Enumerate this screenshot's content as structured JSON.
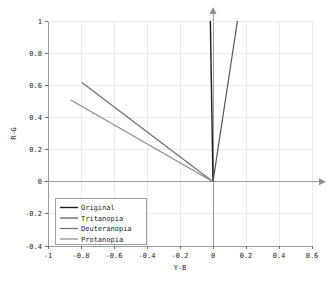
{
  "chart_data": {
    "type": "line",
    "title": "",
    "xlabel": "Y-B",
    "ylabel": "R-G",
    "xlim": [
      -1.0,
      0.6
    ],
    "ylim": [
      -0.4,
      1.0
    ],
    "xticks": [
      -1,
      -0.8,
      -0.6,
      -0.4,
      -0.2,
      0,
      0.2,
      0.4,
      0.6
    ],
    "yticks": [
      -0.4,
      -0.2,
      0,
      0.2,
      0.4,
      0.6,
      0.8,
      1
    ],
    "xtick_labels": [
      "-1",
      "-0.8",
      "-0.6",
      "-0.4",
      "-0.2",
      "0",
      "0.2",
      "0.4",
      "0.6"
    ],
    "ytick_labels": [
      "-0.4",
      "-0.2",
      "0",
      "0.2",
      "0.4",
      "0.6",
      "0.8",
      "1"
    ],
    "grid": true,
    "legend_position": "lower left",
    "series": [
      {
        "name": "Original",
        "color": "#1c1c1c",
        "linewidth": 1.4,
        "points": [
          [
            0.0,
            0.0
          ],
          [
            -0.016,
            1.0
          ]
        ]
      },
      {
        "name": "Tritanopia",
        "color": "#555555",
        "linewidth": 1.2,
        "points": [
          [
            0.0,
            0.0
          ],
          [
            0.148,
            1.0
          ]
        ]
      },
      {
        "name": "Deuteranopia",
        "color": "#6f6f6f",
        "linewidth": 1.2,
        "points": [
          [
            0.0,
            0.0
          ],
          [
            -0.795,
            0.617
          ]
        ]
      },
      {
        "name": "Protanopia",
        "color": "#8a8a8a",
        "linewidth": 1.2,
        "points": [
          [
            0.0,
            0.0
          ],
          [
            -0.862,
            0.508
          ]
        ]
      }
    ],
    "annotations": [
      {
        "name": "y-axis-arrow",
        "shape": "triangle-up",
        "x": 0.0,
        "y": 1.0
      },
      {
        "name": "x-axis-arrow",
        "shape": "triangle-right",
        "x": 0.6,
        "y": 0.0
      }
    ],
    "axis_colors": {
      "grid": "#e8e8f0",
      "spine": "#9a9a9a",
      "text": "#1a1a1a",
      "legend_border": "#9aa0b0",
      "background": "#ffffff"
    }
  }
}
